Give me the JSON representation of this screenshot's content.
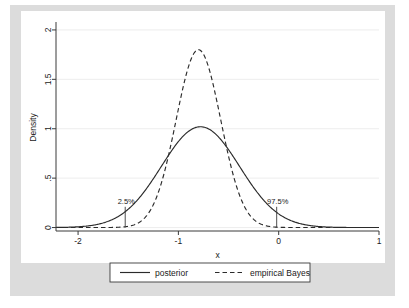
{
  "chart_data": {
    "type": "line",
    "title": "",
    "xlabel": "x",
    "ylabel": "Density",
    "xlim": [
      -2.22,
      1.0
    ],
    "ylim": [
      -0.035,
      2.06
    ],
    "grid": "horizontal",
    "x_ticks": [
      {
        "value": -2,
        "label": "-2"
      },
      {
        "value": -1,
        "label": "-1"
      },
      {
        "value": 0,
        "label": "0"
      },
      {
        "value": 1,
        "label": "1"
      }
    ],
    "y_ticks": [
      {
        "value": 0,
        "label": "0"
      },
      {
        "value": 0.5,
        "label": ".5"
      },
      {
        "value": 1,
        "label": "1"
      },
      {
        "value": 1.5,
        "label": "1.5"
      },
      {
        "value": 2,
        "label": "2"
      }
    ],
    "series": [
      {
        "name": "posterior",
        "style": "solid",
        "distribution": "normal",
        "mean": -0.78,
        "sd": 0.39,
        "peak_density": 1.02,
        "color": "#2b2b2b"
      },
      {
        "name": "empirical Bayes",
        "style": "dashed",
        "distribution": "normal",
        "mean": -0.8,
        "sd": 0.222,
        "peak_density": 1.8,
        "color": "#2b2b2b"
      }
    ],
    "annotations": [
      {
        "label": "2.5%",
        "x": -1.53,
        "y_top": 0.21,
        "marker": "vertical-line"
      },
      {
        "label": "97.5%",
        "x": -0.02,
        "y_top": 0.21,
        "marker": "vertical-line"
      }
    ],
    "legend": {
      "position": "bottom",
      "entries": [
        {
          "label": "posterior",
          "style": "solid"
        },
        {
          "label": "empirical Bayes",
          "style": "dashed"
        }
      ]
    }
  }
}
